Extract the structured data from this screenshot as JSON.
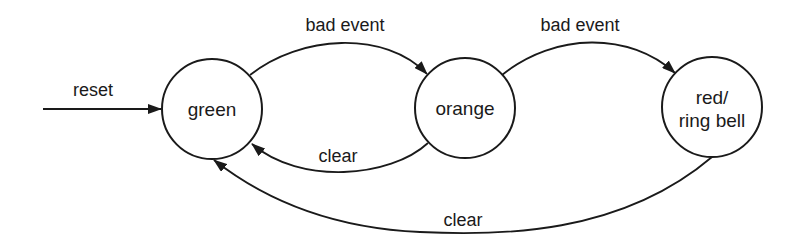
{
  "diagram": {
    "type": "state-machine",
    "states": [
      {
        "id": "green",
        "label_lines": [
          "green"
        ]
      },
      {
        "id": "orange",
        "label_lines": [
          "orange"
        ]
      },
      {
        "id": "red",
        "label_lines": [
          "red/",
          "ring bell"
        ]
      }
    ],
    "transitions": [
      {
        "from": null,
        "to": "green",
        "label": "reset"
      },
      {
        "from": "green",
        "to": "orange",
        "label": "bad event"
      },
      {
        "from": "orange",
        "to": "red",
        "label": "bad event"
      },
      {
        "from": "orange",
        "to": "green",
        "label": "clear"
      },
      {
        "from": "red",
        "to": "green",
        "label": "clear"
      }
    ],
    "colors": {
      "stroke": "#1a1a1a",
      "background": "#ffffff"
    }
  }
}
